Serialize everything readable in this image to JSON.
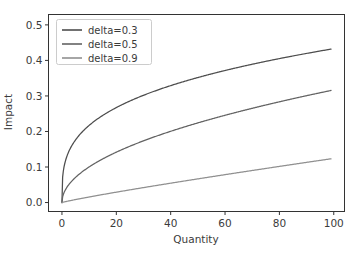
{
  "chart_data": {
    "type": "line",
    "title": "",
    "xlabel": "Quantity",
    "ylabel": "Impact",
    "xlim": [
      -4.95,
      103.95
    ],
    "ylim": [
      -0.0252,
      0.5292
    ],
    "xticks": [
      0,
      20,
      40,
      60,
      80,
      100
    ],
    "xtick_labels": [
      "0",
      "20",
      "40",
      "60",
      "80",
      "100"
    ],
    "yticks": [
      0.0,
      0.1,
      0.2,
      0.3,
      0.4,
      0.5
    ],
    "ytick_labels": [
      "0.0",
      "0.1",
      "0.2",
      "0.3",
      "0.4",
      "0.5"
    ],
    "grid": false,
    "legend_position": "upper left",
    "series": [
      {
        "name": "delta=0.3",
        "label": "delta=0.3",
        "color": "#4d4d4d",
        "delta": 0.3,
        "coefficient": 0.1088,
        "x": [
          0,
          0.5,
          1,
          2,
          3,
          5,
          7,
          10,
          15,
          20,
          25,
          30,
          35,
          40,
          45,
          50,
          55,
          60,
          65,
          70,
          75,
          80,
          85,
          90,
          95,
          99
        ],
        "values": [
          0.0,
          0.0884,
          0.1088,
          0.1339,
          0.1512,
          0.1752,
          0.1932,
          0.2169,
          0.2462,
          0.267,
          0.2838,
          0.2977,
          0.3098,
          0.3204,
          0.33,
          0.3386,
          0.3466,
          0.354,
          0.3609,
          0.3673,
          0.3734,
          0.3792,
          0.3847,
          0.3899,
          0.3949,
          0.3988
        ]
      },
      {
        "name": "delta=0.5",
        "label": "delta=0.5",
        "color": "#636363",
        "delta": 0.5,
        "coefficient": 0.0317,
        "x": [
          0,
          0.5,
          1,
          2,
          3,
          5,
          7,
          10,
          15,
          20,
          25,
          30,
          35,
          40,
          45,
          50,
          55,
          60,
          65,
          70,
          75,
          80,
          85,
          90,
          95,
          99
        ],
        "values": [
          0.0,
          0.0224,
          0.0317,
          0.0448,
          0.0549,
          0.0709,
          0.0839,
          0.1002,
          0.1228,
          0.1418,
          0.1585,
          0.1736,
          0.1875,
          0.2005,
          0.2126,
          0.2241,
          0.2351,
          0.2456,
          0.2556,
          0.2652,
          0.2745,
          0.2835,
          0.2922,
          0.3007,
          0.309,
          0.3154
        ]
      },
      {
        "name": "delta=0.9",
        "label": "delta=0.9",
        "color": "#909090",
        "delta": 0.9,
        "coefficient": 0.00197,
        "x": [
          0,
          0.5,
          1,
          2,
          3,
          5,
          7,
          10,
          15,
          20,
          25,
          30,
          35,
          40,
          45,
          50,
          55,
          60,
          65,
          70,
          75,
          80,
          85,
          90,
          95,
          99
        ],
        "values": [
          0.0,
          0.00106,
          0.00197,
          0.00368,
          0.00531,
          0.00843,
          0.01141,
          0.01567,
          0.02249,
          0.02905,
          0.03541,
          0.04162,
          0.0477,
          0.05368,
          0.05958,
          0.06539,
          0.07114,
          0.07683,
          0.08246,
          0.08804,
          0.09358,
          0.09907,
          0.10453,
          0.10995,
          0.11534,
          0.11956
        ]
      }
    ]
  },
  "legend": {
    "entries": [
      {
        "label": "delta=0.3"
      },
      {
        "label": "delta=0.5"
      },
      {
        "label": "delta=0.9"
      }
    ]
  },
  "axes": {
    "x_title": "Quantity",
    "y_title": "Impact"
  }
}
